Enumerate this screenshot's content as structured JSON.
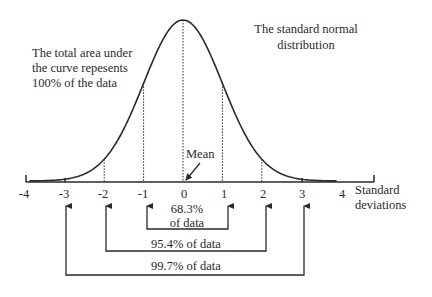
{
  "title": {
    "line1": "The standard normal",
    "line2": "distribution"
  },
  "area_note": {
    "line1": "The total area under",
    "line2": "the curve repesents",
    "line3": "100% of the data"
  },
  "mean_label": "Mean",
  "axis": {
    "label_line1": "Standard",
    "label_line2": "deviations",
    "ticks": [
      "-4",
      "-3",
      "-2",
      "-1",
      "0",
      "1",
      "2",
      "3",
      "4"
    ]
  },
  "brackets": {
    "one_sigma": {
      "line1": "68.3%",
      "line2": "of data"
    },
    "two_sigma": "95.4% of data",
    "three_sigma": "99.7% of data"
  },
  "colors": {
    "ink": "#2a2a2a",
    "background": "#ffffff"
  }
}
